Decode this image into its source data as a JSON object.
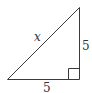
{
  "diagram": {
    "type": "right-triangle",
    "vertices": {
      "top": [
        79.5,
        7.5
      ],
      "bottom_left": [
        7.5,
        79.5
      ],
      "bottom_right": [
        79.5,
        79.5
      ]
    },
    "right_angle_marker": {
      "x": 68.5,
      "y": 68.5,
      "size": 11
    },
    "labels": {
      "hypotenuse": "x",
      "vertical_leg": "5",
      "horizontal_leg": "5"
    },
    "colors": {
      "stroke": "#3a3a3a",
      "text": "#333333",
      "background": "#ffffff"
    }
  }
}
